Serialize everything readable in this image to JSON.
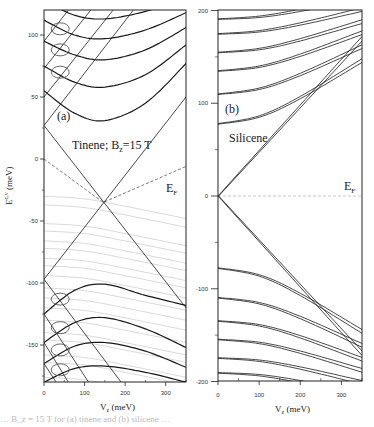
{
  "chart_data": [
    {
      "type": "line",
      "panel_label": "(a)",
      "title": "Tinene; B_z=15 T",
      "xlabel": "V_z (meV)",
      "ylabel": "E^{c,v} (meV)",
      "xlim": [
        0,
        350
      ],
      "ylim": [
        -180,
        120
      ],
      "xticks": [
        0,
        100,
        200,
        300
      ],
      "yticks": [
        100,
        50,
        0,
        -50,
        -100,
        -150
      ],
      "ytick_labels": [
        "100",
        "50",
        "0",
        "-50",
        "-100",
        "-150"
      ],
      "xtick_labels": [
        "0",
        "100",
        "200",
        "300"
      ],
      "fermi_label": "E_F",
      "fermi_level": {
        "x": [
          0,
          146,
          350
        ],
        "y": [
          0,
          -35,
          -6
        ]
      },
      "series": [
        {
          "name": "zeroth LL (descending)",
          "x": [
            0,
            350
          ],
          "y": [
            27,
            -120
          ]
        },
        {
          "name": "zeroth LL (ascending)",
          "x": [
            0,
            350
          ],
          "y": [
            -97,
            50
          ]
        },
        {
          "name": "conduction LL 1",
          "x": [
            0,
            75,
            150,
            250,
            350
          ],
          "y": [
            55,
            37,
            31,
            45,
            77
          ]
        },
        {
          "name": "conduction LL 2",
          "x": [
            0,
            75,
            150,
            250,
            350
          ],
          "y": [
            75,
            62,
            58,
            68,
            92
          ]
        },
        {
          "name": "conduction LL 3",
          "x": [
            0,
            75,
            150,
            250,
            350
          ],
          "y": [
            95,
            84,
            80,
            88,
            106
          ]
        },
        {
          "name": "conduction LL 4",
          "x": [
            0,
            75,
            150,
            250,
            350
          ],
          "y": [
            112,
            100,
            97,
            104,
            118
          ]
        },
        {
          "name": "conduction LL 5",
          "x": [
            0,
            75,
            150,
            250,
            350
          ],
          "y": [
            128,
            116,
            113,
            119,
            130
          ]
        },
        {
          "name": "steep rising 1",
          "x": [
            0,
            220
          ],
          "y": [
            27,
            120
          ]
        },
        {
          "name": "steep rising 2",
          "x": [
            0,
            170
          ],
          "y": [
            50,
            120
          ]
        },
        {
          "name": "steep rising 3",
          "x": [
            0,
            115
          ],
          "y": [
            73,
            120
          ]
        },
        {
          "name": "steep rising 4",
          "x": [
            0,
            60
          ],
          "y": [
            95,
            120
          ]
        },
        {
          "name": "valence LL 1",
          "x": [
            0,
            75,
            150,
            250,
            350
          ],
          "y": [
            -125,
            -106,
            -101,
            -110,
            -118
          ]
        },
        {
          "name": "valence LL 2",
          "x": [
            0,
            75,
            150,
            250,
            350
          ],
          "y": [
            -148,
            -132,
            -128,
            -137,
            -152
          ]
        },
        {
          "name": "valence LL 3",
          "x": [
            0,
            75,
            150,
            250,
            350
          ],
          "y": [
            -165,
            -151,
            -148,
            -155,
            -168
          ]
        },
        {
          "name": "valence LL 4",
          "x": [
            0,
            75,
            150,
            250,
            350
          ],
          "y": [
            -180,
            -169,
            -167,
            -172,
            -180
          ]
        },
        {
          "name": "steep falling 1",
          "x": [
            0,
            190
          ],
          "y": [
            -97,
            -180
          ]
        },
        {
          "name": "steep falling 2",
          "x": [
            0,
            110
          ],
          "y": [
            -125,
            -180
          ]
        },
        {
          "name": "steep falling 3",
          "x": [
            0,
            60
          ],
          "y": [
            -148,
            -180
          ]
        },
        {
          "name": "steep falling 4",
          "x": [
            0,
            30
          ],
          "y": [
            -165,
            -180
          ]
        }
      ],
      "gray_series_y0": [
        -30,
        -37,
        -52,
        -58,
        -66,
        -72,
        -80,
        -86,
        -94,
        -104,
        -112,
        -120,
        -130,
        -140,
        -146,
        -158,
        -164,
        -176
      ],
      "gray_series_drop_at_350": 18,
      "ellipses": [
        {
          "x": 40,
          "y": 105
        },
        {
          "x": 40,
          "y": 88
        },
        {
          "x": 40,
          "y": 70
        },
        {
          "x": 40,
          "y": -113
        },
        {
          "x": 40,
          "y": -136
        },
        {
          "x": 40,
          "y": -154
        },
        {
          "x": 40,
          "y": -170
        }
      ]
    },
    {
      "type": "line",
      "panel_label": "(b)",
      "title": "Silicene",
      "xlabel": "V_z (meV)",
      "ylabel": "",
      "xlim": [
        0,
        350
      ],
      "ylim": [
        -200,
        200
      ],
      "xticks": [
        0,
        100,
        200,
        300
      ],
      "yticks": [
        200,
        100,
        0,
        -100,
        -200
      ],
      "ytick_labels": [
        "200",
        "100",
        "0",
        "-100",
        "-200"
      ],
      "xtick_labels": [
        "0",
        "100",
        "200",
        "300"
      ],
      "fermi_label": "E_F",
      "fermi_level": {
        "x": [
          0,
          350
        ],
        "y": [
          0,
          0
        ]
      },
      "series": [
        {
          "name": "zeroth LL up",
          "x": [
            0,
            350
          ],
          "y": [
            0,
            172
          ],
          "doublet_gap": 5
        },
        {
          "name": "zeroth LL down",
          "x": [
            0,
            350
          ],
          "y": [
            0,
            -172
          ],
          "doublet_gap": 5
        },
        {
          "name": "conduction LL 1",
          "x0": 0,
          "y0": 78,
          "y350": 148,
          "doublet_gap": 4
        },
        {
          "name": "conduction LL 2",
          "x0": 0,
          "y0": 110,
          "y350": 163,
          "doublet_gap": 4
        },
        {
          "name": "conduction LL 3",
          "x0": 0,
          "y0": 135,
          "y350": 178,
          "doublet_gap": 4
        },
        {
          "name": "conduction LL 4",
          "x0": 0,
          "y0": 155,
          "y350": 190,
          "doublet_gap": 4
        },
        {
          "name": "conduction LL 5",
          "x0": 0,
          "y0": 175,
          "y350": 203,
          "doublet_gap": 4
        },
        {
          "name": "conduction LL 6",
          "x0": 0,
          "y0": 191,
          "y350": 216,
          "doublet_gap": 4
        },
        {
          "name": "valence LL 1",
          "x0": 0,
          "y0": -78,
          "y350": -148,
          "doublet_gap": 4
        },
        {
          "name": "valence LL 2",
          "x0": 0,
          "y0": -110,
          "y350": -163,
          "doublet_gap": 4
        },
        {
          "name": "valence LL 3",
          "x0": 0,
          "y0": -135,
          "y350": -178,
          "doublet_gap": 4
        },
        {
          "name": "valence LL 4",
          "x0": 0,
          "y0": -155,
          "y350": -190,
          "doublet_gap": 4
        },
        {
          "name": "valence LL 5",
          "x0": 0,
          "y0": -175,
          "y350": -203,
          "doublet_gap": 4
        },
        {
          "name": "valence LL 6",
          "x0": 0,
          "y0": -191,
          "y350": -216,
          "doublet_gap": 4
        }
      ]
    }
  ],
  "caption_fragment": "…  B_z = 15 T for (a) tinene and (b) silicene …"
}
